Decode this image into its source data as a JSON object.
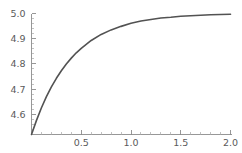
{
  "chart_data": {
    "type": "line",
    "title": "",
    "subtitle": "",
    "xlabel": "",
    "ylabel": "",
    "xlim": [
      0,
      2.0
    ],
    "ylim": [
      4.52,
      5.0
    ],
    "grid": false,
    "legend": null,
    "legend_position": "none",
    "axis_color": "#8c8c8c",
    "curve_color": "#525252",
    "background_color": "#ffffff",
    "x_ticks": [
      {
        "value": 0.5,
        "label": "0.5"
      },
      {
        "value": 1.0,
        "label": "1.0"
      },
      {
        "value": 1.5,
        "label": "1.5"
      },
      {
        "value": 2.0,
        "label": "2.0"
      }
    ],
    "x_minor_ticks": [
      0.1,
      0.2,
      0.3,
      0.4,
      0.6,
      0.7,
      0.8,
      0.9,
      1.1,
      1.2,
      1.3,
      1.4,
      1.6,
      1.7,
      1.8,
      1.9
    ],
    "y_ticks": [
      {
        "value": 4.6,
        "label": "4.6"
      },
      {
        "value": 4.7,
        "label": "4.7"
      },
      {
        "value": 4.8,
        "label": "4.8"
      },
      {
        "value": 4.9,
        "label": "4.9"
      },
      {
        "value": 5.0,
        "label": "5.0"
      }
    ],
    "y_minor_ticks": [
      4.54,
      4.56,
      4.58,
      4.62,
      4.64,
      4.66,
      4.68,
      4.72,
      4.74,
      4.76,
      4.78,
      4.82,
      4.84,
      4.86,
      4.88,
      4.92,
      4.94,
      4.96,
      4.98
    ],
    "series": [
      {
        "name": "curve",
        "x": [
          0.0,
          0.05,
          0.1,
          0.15,
          0.2,
          0.25,
          0.3,
          0.35,
          0.4,
          0.45,
          0.5,
          0.6,
          0.7,
          0.8,
          0.9,
          1.0,
          1.1,
          1.2,
          1.3,
          1.4,
          1.5,
          1.6,
          1.7,
          1.8,
          1.9,
          2.0
        ],
        "y": [
          4.52,
          4.576,
          4.626,
          4.67,
          4.709,
          4.743,
          4.773,
          4.8,
          4.823,
          4.844,
          4.862,
          4.893,
          4.917,
          4.935,
          4.949,
          4.961,
          4.97,
          4.976,
          4.982,
          4.985,
          4.989,
          4.991,
          4.993,
          4.995,
          4.996,
          4.997
        ]
      }
    ]
  }
}
